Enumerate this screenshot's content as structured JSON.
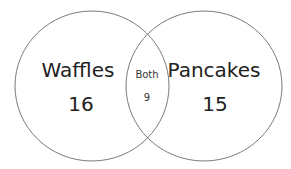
{
  "diagram": {
    "type": "venn",
    "sets": [
      {
        "label": "Waffles",
        "value": "16"
      },
      {
        "label": "Pancakes",
        "value": "15"
      }
    ],
    "intersection": {
      "label": "Both",
      "value": "9"
    },
    "colors": {
      "stroke": "#7a7a7a",
      "text": "#222222",
      "background": "#ffffff"
    }
  }
}
